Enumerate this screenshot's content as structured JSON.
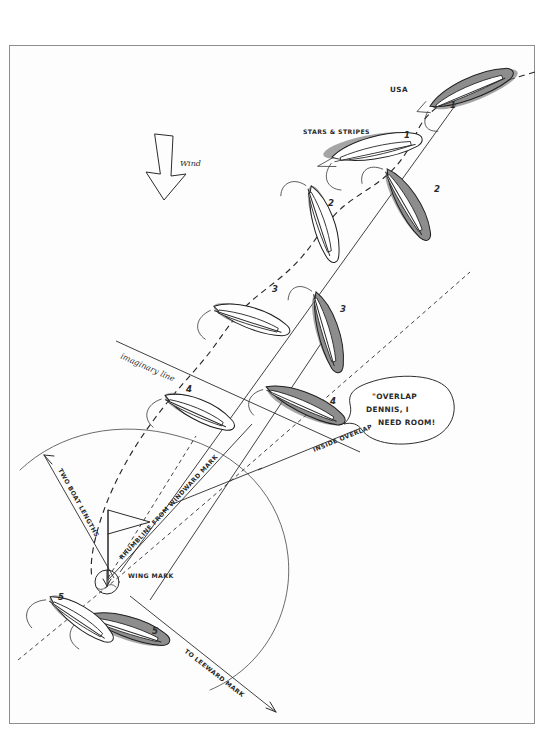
{
  "diagram": {
    "medium": "hand-drawn pen sketch",
    "border_color": "#8e8e8e",
    "background": "#ffffff"
  },
  "wind": {
    "label": "Wind",
    "direction": "down"
  },
  "boats": {
    "usa": {
      "name": "USA",
      "hull_color": "#8d8d8d",
      "style": "shaded",
      "positions": [
        "1",
        "2",
        "3",
        "4",
        "5"
      ]
    },
    "stars_and_stripes": {
      "name": "STARS & STRIPES",
      "hull_color": "#ffffff",
      "style": "outline",
      "positions": [
        "1",
        "2",
        "3",
        "4",
        "5"
      ]
    }
  },
  "annotations": {
    "imaginary_line": "imaginary line",
    "inside_overlap": "INSIDE OVERLAP",
    "two_boat_lengths": "TWO BOAT LENGTHS",
    "rhumbline": "RHUMBLINE FROM WINDWARD MARK",
    "wing_mark": "WING MARK",
    "to_leeward_mark": "TO LEEWARD MARK"
  },
  "speech_bubble": {
    "line1": "\"OVERLAP",
    "line2": "DENNIS, I",
    "line3": "NEED ROOM!"
  }
}
